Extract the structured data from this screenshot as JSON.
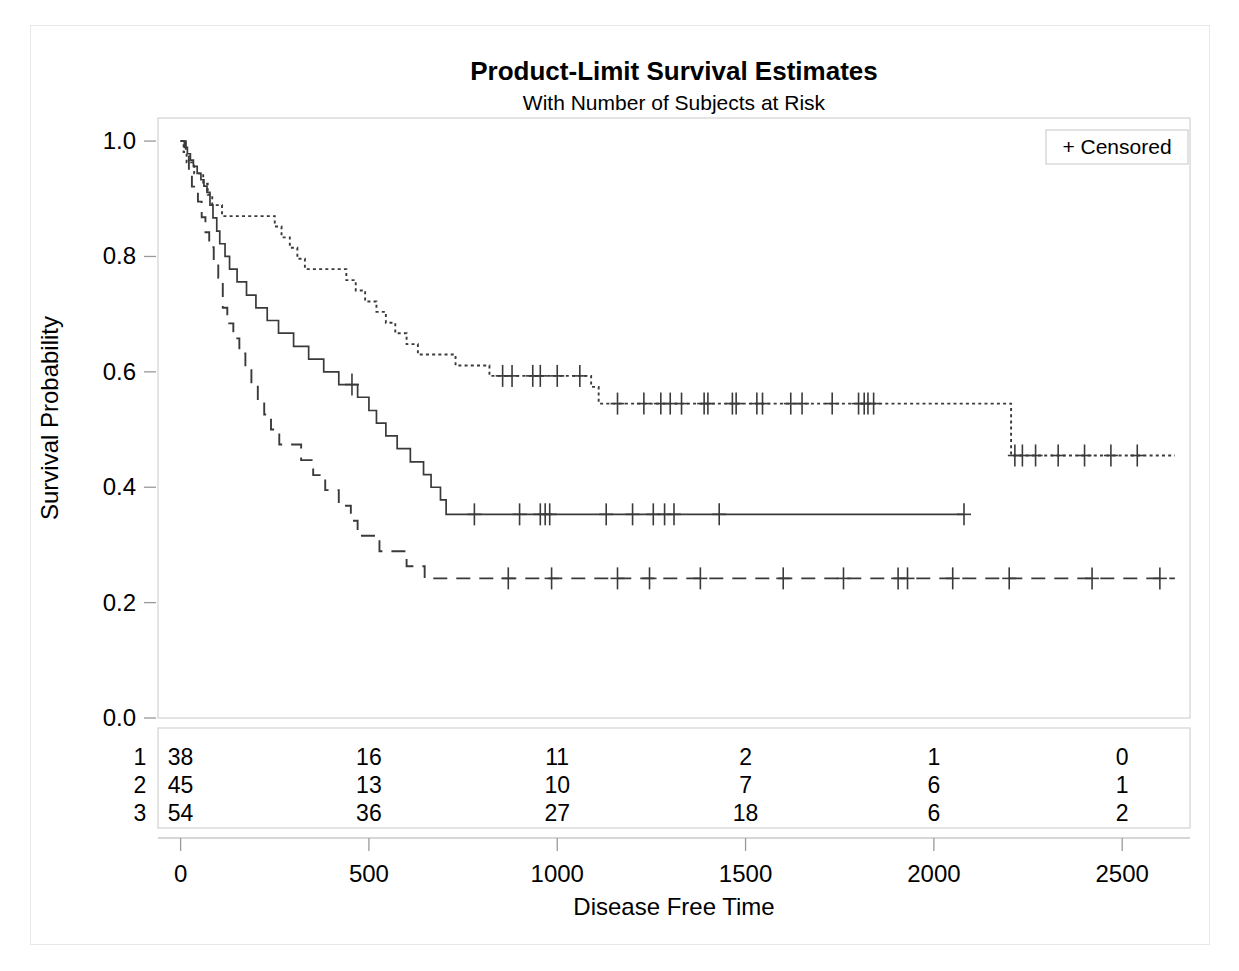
{
  "chart_data": {
    "type": "line",
    "title": "Product-Limit Survival Estimates",
    "subtitle": "With Number of Subjects at Risk",
    "xlabel": "Disease Free Time",
    "ylabel": "Survival Probability",
    "xlim": [
      -60,
      2680
    ],
    "ylim": [
      0.0,
      1.04
    ],
    "xticks": [
      0,
      500,
      1000,
      1500,
      2000,
      2500
    ],
    "xticklabels": [
      "0",
      "500",
      "1000",
      "1500",
      "2000",
      "2500"
    ],
    "yticks": [
      0.0,
      0.2,
      0.4,
      0.6,
      0.8,
      1.0
    ],
    "yticklabels": [
      "0.0",
      "0.2",
      "0.4",
      "0.6",
      "0.8",
      "1.0"
    ],
    "grid": false,
    "legend": {
      "position": "top-right",
      "entries": [
        {
          "marker": "+",
          "label": "Censored"
        }
      ]
    },
    "legend_label": "+ Censored",
    "censor_marker": "+",
    "line_color": "#3a3a3a",
    "series": [
      {
        "name": "1",
        "stratum": 1,
        "style": "dashed",
        "steps": [
          [
            0,
            1.0
          ],
          [
            14,
            0.974
          ],
          [
            22,
            0.947
          ],
          [
            30,
            0.921
          ],
          [
            38,
            0.921
          ],
          [
            46,
            0.895
          ],
          [
            56,
            0.868
          ],
          [
            66,
            0.842
          ],
          [
            76,
            0.816
          ],
          [
            88,
            0.789
          ],
          [
            100,
            0.763
          ],
          [
            112,
            0.711
          ],
          [
            124,
            0.684
          ],
          [
            140,
            0.658
          ],
          [
            156,
            0.632
          ],
          [
            172,
            0.605
          ],
          [
            188,
            0.579
          ],
          [
            205,
            0.553
          ],
          [
            222,
            0.526
          ],
          [
            240,
            0.5
          ],
          [
            262,
            0.474
          ],
          [
            300,
            0.474
          ],
          [
            320,
            0.447
          ],
          [
            352,
            0.421
          ],
          [
            384,
            0.395
          ],
          [
            420,
            0.368
          ],
          [
            452,
            0.342
          ],
          [
            470,
            0.316
          ],
          [
            500,
            0.316
          ],
          [
            528,
            0.289
          ],
          [
            560,
            0.289
          ],
          [
            600,
            0.263
          ],
          [
            648,
            0.242
          ],
          [
            2640,
            0.242
          ]
        ],
        "censored": [
          870,
          985,
          1160,
          1245,
          1380,
          1600,
          1760,
          1905,
          1930,
          2050,
          2200,
          2420,
          2600
        ]
      },
      {
        "name": "2",
        "stratum": 2,
        "style": "solid",
        "steps": [
          [
            0,
            1.0
          ],
          [
            10,
            0.989
          ],
          [
            18,
            0.978
          ],
          [
            26,
            0.967
          ],
          [
            34,
            0.956
          ],
          [
            44,
            0.944
          ],
          [
            54,
            0.933
          ],
          [
            62,
            0.922
          ],
          [
            70,
            0.911
          ],
          [
            78,
            0.889
          ],
          [
            86,
            0.867
          ],
          [
            96,
            0.844
          ],
          [
            104,
            0.822
          ],
          [
            118,
            0.8
          ],
          [
            130,
            0.778
          ],
          [
            150,
            0.756
          ],
          [
            175,
            0.733
          ],
          [
            200,
            0.711
          ],
          [
            230,
            0.689
          ],
          [
            260,
            0.667
          ],
          [
            300,
            0.644
          ],
          [
            340,
            0.622
          ],
          [
            380,
            0.6
          ],
          [
            420,
            0.578
          ],
          [
            455,
            0.578
          ],
          [
            470,
            0.556
          ],
          [
            500,
            0.533
          ],
          [
            520,
            0.511
          ],
          [
            545,
            0.489
          ],
          [
            575,
            0.467
          ],
          [
            610,
            0.444
          ],
          [
            645,
            0.422
          ],
          [
            665,
            0.4
          ],
          [
            690,
            0.378
          ],
          [
            705,
            0.353
          ],
          [
            2080,
            0.353
          ]
        ],
        "censored": [
          455,
          780,
          900,
          955,
          968,
          980,
          1130,
          1200,
          1255,
          1285,
          1310,
          1430,
          2080
        ]
      },
      {
        "name": "3",
        "stratum": 3,
        "style": "dotted",
        "steps": [
          [
            0,
            1.0
          ],
          [
            8,
            0.981
          ],
          [
            16,
            0.963
          ],
          [
            26,
            0.963
          ],
          [
            36,
            0.944
          ],
          [
            48,
            0.944
          ],
          [
            60,
            0.926
          ],
          [
            72,
            0.907
          ],
          [
            84,
            0.889
          ],
          [
            96,
            0.889
          ],
          [
            110,
            0.87
          ],
          [
            230,
            0.87
          ],
          [
            250,
            0.852
          ],
          [
            268,
            0.833
          ],
          [
            290,
            0.815
          ],
          [
            310,
            0.796
          ],
          [
            330,
            0.778
          ],
          [
            415,
            0.778
          ],
          [
            440,
            0.759
          ],
          [
            465,
            0.741
          ],
          [
            490,
            0.722
          ],
          [
            520,
            0.704
          ],
          [
            545,
            0.685
          ],
          [
            570,
            0.667
          ],
          [
            600,
            0.648
          ],
          [
            630,
            0.63
          ],
          [
            700,
            0.63
          ],
          [
            730,
            0.611
          ],
          [
            790,
            0.611
          ],
          [
            820,
            0.593
          ],
          [
            1060,
            0.593
          ],
          [
            1090,
            0.574
          ],
          [
            1110,
            0.545
          ],
          [
            2200,
            0.545
          ],
          [
            2205,
            0.455
          ],
          [
            2640,
            0.455
          ]
        ],
        "censored": [
          855,
          880,
          935,
          955,
          1000,
          1060,
          1160,
          1230,
          1275,
          1300,
          1330,
          1390,
          1400,
          1465,
          1475,
          1530,
          1545,
          1620,
          1650,
          1730,
          1800,
          1815,
          1825,
          1840,
          2215,
          2235,
          2270,
          2330,
          2400,
          2470,
          2540
        ]
      }
    ],
    "risk_table": {
      "row_labels": [
        "1",
        "2",
        "3"
      ],
      "times": [
        0,
        500,
        1000,
        1500,
        2000,
        2500
      ],
      "rows": [
        {
          "label": "1",
          "counts": [
            38,
            16,
            11,
            2,
            1,
            0
          ]
        },
        {
          "label": "2",
          "counts": [
            45,
            13,
            10,
            7,
            6,
            1
          ]
        },
        {
          "label": "3",
          "counts": [
            54,
            36,
            27,
            18,
            6,
            2
          ]
        }
      ]
    }
  }
}
